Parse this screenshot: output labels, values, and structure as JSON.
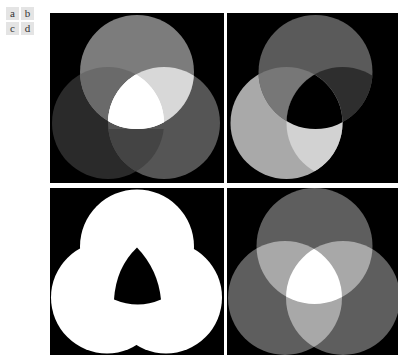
{
  "labels": [
    "a",
    "b",
    "c",
    "d"
  ],
  "panels": [
    {
      "id": "a",
      "description": "Three overlapping circles of different gray levels, intersection brighter (additive)",
      "circles": [
        {
          "cx": 87,
          "cy": 59,
          "r": 57,
          "fill": "#7a7a7a"
        },
        {
          "cx": 58,
          "cy": 110,
          "r": 56,
          "fill": "#2c2c2c"
        },
        {
          "cx": 114,
          "cy": 110,
          "r": 56,
          "fill": "#555555"
        }
      ]
    },
    {
      "id": "b",
      "description": "Three overlapping circles with XOR-like combination, central region black"
    },
    {
      "id": "c",
      "description": "Union of three circles shown white with black central curved triangle hole"
    },
    {
      "id": "d",
      "description": "Three equal gray circles, pairwise overlaps lighter, triple overlap white"
    }
  ],
  "colors": {
    "background": "#000000",
    "page": "#ffffff",
    "label_bg": "#e4e4e4"
  }
}
